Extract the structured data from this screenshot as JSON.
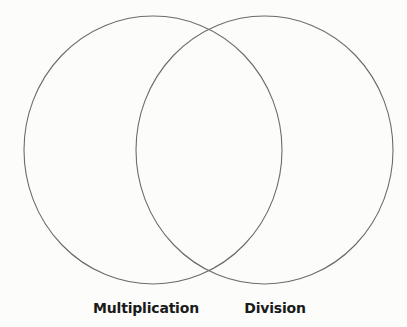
{
  "diagram": {
    "type": "venn",
    "background_color": "#fcfcfb",
    "stroke_color": "#6b6b6b",
    "sets": [
      {
        "id": "left",
        "label": "Multiplication",
        "shape": {
          "cx": 153,
          "cy": 150,
          "rx": 129,
          "ry": 134
        }
      },
      {
        "id": "right",
        "label": "Division",
        "shape": {
          "cx": 264.5,
          "cy": 150,
          "rx": 128.5,
          "ry": 134
        }
      }
    ],
    "regions": {
      "left_only": [],
      "intersection": [],
      "right_only": []
    }
  }
}
